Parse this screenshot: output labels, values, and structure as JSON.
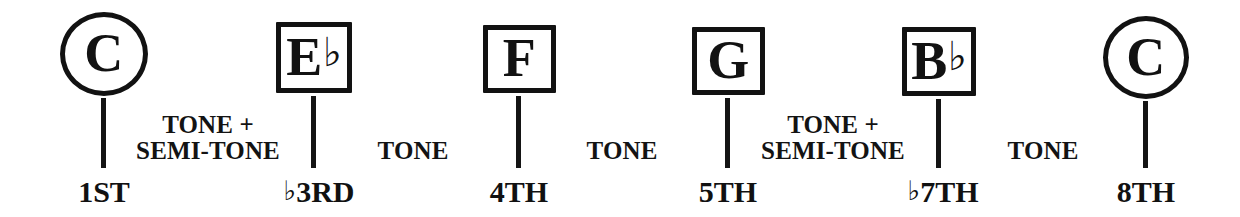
{
  "diagram": {
    "background_color": "#ffffff",
    "ink_color": "#121212"
  },
  "notes": [
    {
      "id": "note-root-c",
      "letter": "C",
      "accidental": "",
      "shape": "circle",
      "degree_label_letters": "1ST",
      "degree_has_flat": false
    },
    {
      "id": "note-e-flat",
      "letter": "E",
      "accidental": "♭",
      "shape": "square",
      "degree_label_letters": "3RD",
      "degree_has_flat": true
    },
    {
      "id": "note-f",
      "letter": "F",
      "accidental": "",
      "shape": "square",
      "degree_label_letters": "4TH",
      "degree_has_flat": false
    },
    {
      "id": "note-g",
      "letter": "G",
      "accidental": "",
      "shape": "square",
      "degree_label_letters": "5TH",
      "degree_has_flat": false
    },
    {
      "id": "note-b-flat",
      "letter": "B",
      "accidental": "♭",
      "shape": "square",
      "degree_label_letters": "7TH",
      "degree_has_flat": true
    },
    {
      "id": "note-octave-c",
      "letter": "C",
      "accidental": "",
      "shape": "circle",
      "degree_label_letters": "8TH",
      "degree_has_flat": false
    }
  ],
  "degrees": [
    {
      "flat": "",
      "text": "1ST"
    },
    {
      "flat": "♭",
      "text": "3RD"
    },
    {
      "flat": "",
      "text": "4TH"
    },
    {
      "flat": "",
      "text": "5TH"
    },
    {
      "flat": "♭",
      "text": "7TH"
    },
    {
      "flat": "",
      "text": "8TH"
    }
  ],
  "intervals": [
    {
      "id": "interval-1",
      "line1": "TONE +",
      "line2": "SEMI-TONE",
      "from": "C",
      "to": "E♭"
    },
    {
      "id": "interval-2",
      "line1": "TONE",
      "line2": "",
      "from": "E♭",
      "to": "F"
    },
    {
      "id": "interval-3",
      "line1": "TONE",
      "line2": "",
      "from": "F",
      "to": "G"
    },
    {
      "id": "interval-4",
      "line1": "TONE +",
      "line2": "SEMI-TONE",
      "from": "G",
      "to": "B♭"
    },
    {
      "id": "interval-5",
      "line1": "TONE",
      "line2": "",
      "from": "B♭",
      "to": "C"
    }
  ]
}
